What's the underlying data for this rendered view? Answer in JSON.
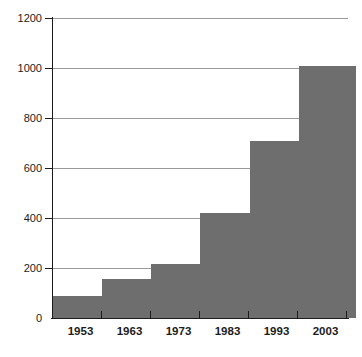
{
  "chart_data": {
    "type": "bar",
    "title": "",
    "subtitle": "",
    "xlabel": "",
    "ylabel": "",
    "categories": [
      "1953",
      "1963",
      "1973",
      "1983",
      "1993",
      "2003"
    ],
    "values": [
      90,
      155,
      215,
      420,
      710,
      1010
    ],
    "series": [
      {
        "name": "",
        "values": [
          90,
          155,
          215,
          420,
          710,
          1010
        ]
      }
    ],
    "ylim": [
      0,
      1200
    ],
    "ytick_labels": [
      "0",
      "200",
      "400",
      "600",
      "800",
      "1000",
      "1200"
    ],
    "ytick_values": [
      0,
      200,
      400,
      600,
      800,
      1000,
      1200
    ],
    "grid": true,
    "legend": "none",
    "bar_color": "#6e6e6e",
    "gridline_color": "#9a9a9a",
    "axis_color": "#1c1c1c",
    "background_color": "#ffffff"
  }
}
